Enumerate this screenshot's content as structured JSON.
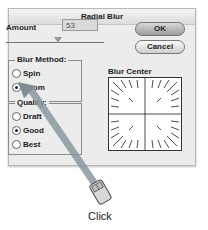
{
  "dialog": {
    "title": "Radial Blur",
    "amount_label": "Amount",
    "amount_value": "53",
    "buttons": {
      "ok": "OK",
      "cancel": "Cancel"
    },
    "blur_method": {
      "title": "Blur Method:",
      "options": [
        {
          "label": "Spin",
          "checked": false
        },
        {
          "label": "Zoom",
          "checked": true
        }
      ]
    },
    "quality": {
      "title": "Quality:",
      "options": [
        {
          "label": "Draft",
          "checked": false
        },
        {
          "label": "Good",
          "checked": true
        },
        {
          "label": "Best",
          "checked": false
        }
      ]
    },
    "blur_center_label": "Blur Center"
  },
  "annotation": {
    "action_label": "Click",
    "icon": "mouse-icon",
    "arrow_color": "#8a9aa0"
  }
}
